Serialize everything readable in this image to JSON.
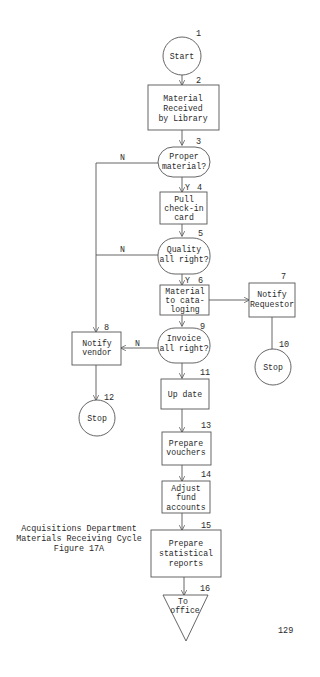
{
  "caption": {
    "line1": "Acquisitions Department",
    "line2": "Materials Receiving Cycle",
    "line3": "Figure 17A"
  },
  "page_number": "129",
  "nodes": [
    {
      "id": "1",
      "type": "terminal-circle",
      "lines": [
        "Start"
      ]
    },
    {
      "id": "2",
      "type": "process",
      "lines": [
        "Material",
        "Received",
        "by Library"
      ]
    },
    {
      "id": "3",
      "type": "decision",
      "lines": [
        "Proper",
        "material?"
      ]
    },
    {
      "id": "4",
      "type": "process",
      "lines": [
        "Pull",
        "check-in",
        "card"
      ]
    },
    {
      "id": "5",
      "type": "decision",
      "lines": [
        "Quality",
        "all right?"
      ]
    },
    {
      "id": "6",
      "type": "process",
      "lines": [
        "Material",
        "to cata-",
        "loging"
      ]
    },
    {
      "id": "7",
      "type": "process",
      "lines": [
        "Notify",
        "Requestor"
      ]
    },
    {
      "id": "8",
      "type": "process",
      "lines": [
        "Notify",
        "vendor"
      ]
    },
    {
      "id": "9",
      "type": "decision",
      "lines": [
        "Invoice",
        "all right?"
      ]
    },
    {
      "id": "10",
      "type": "terminal-circle",
      "lines": [
        "Stop"
      ]
    },
    {
      "id": "11",
      "type": "process",
      "lines": [
        "Up date"
      ]
    },
    {
      "id": "12",
      "type": "terminal-circle",
      "lines": [
        "Stop"
      ]
    },
    {
      "id": "13",
      "type": "process",
      "lines": [
        "Prepare",
        "vouchers"
      ]
    },
    {
      "id": "14",
      "type": "process",
      "lines": [
        "Adjust",
        "fund",
        "accounts"
      ]
    },
    {
      "id": "15",
      "type": "process",
      "lines": [
        "Prepare",
        "statistical",
        "reports"
      ]
    },
    {
      "id": "16",
      "type": "offpage-triangle",
      "lines": [
        "To",
        "office"
      ]
    }
  ],
  "edge_labels": {
    "n3": "N",
    "y3": "Y",
    "n5": "N",
    "y5": "Y",
    "n9": "N"
  },
  "edges": [
    {
      "from": "1",
      "to": "2"
    },
    {
      "from": "2",
      "to": "3"
    },
    {
      "from": "3",
      "to": "4",
      "label": "Y"
    },
    {
      "from": "3",
      "to": "8",
      "label": "N"
    },
    {
      "from": "4",
      "to": "5"
    },
    {
      "from": "5",
      "to": "6",
      "label": "Y"
    },
    {
      "from": "5",
      "to": "8",
      "label": "N"
    },
    {
      "from": "6",
      "to": "7"
    },
    {
      "from": "6",
      "to": "9"
    },
    {
      "from": "7",
      "to": "10"
    },
    {
      "from": "9",
      "to": "8",
      "label": "N"
    },
    {
      "from": "9",
      "to": "11"
    },
    {
      "from": "8",
      "to": "12"
    },
    {
      "from": "11",
      "to": "13"
    },
    {
      "from": "13",
      "to": "14"
    },
    {
      "from": "14",
      "to": "15"
    },
    {
      "from": "15",
      "to": "16"
    }
  ]
}
